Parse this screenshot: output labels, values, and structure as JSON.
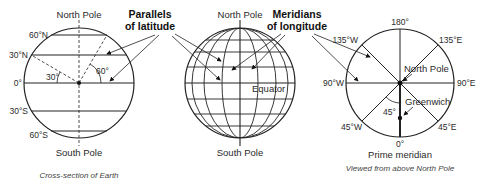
{
  "figure": {
    "left": {
      "title_top": "North Pole",
      "title_bottom": "South Pole",
      "caption": "Cross-section of Earth",
      "latitude_labels": [
        "60°N",
        "30°N",
        "0°",
        "30°S",
        "60°S"
      ],
      "angle_labels": [
        "30°",
        "60°"
      ]
    },
    "middle": {
      "title_top": "North Pole",
      "title_bottom": "South Pole",
      "equator_label": "Equator",
      "parallels_label_line1": "Parallels",
      "parallels_label_line2": "of latitude",
      "meridians_label_line1": "Meridians",
      "meridians_label_line2": "of longitude"
    },
    "right": {
      "center_label": "North Pole",
      "greenwich_label": "Greenwich",
      "angle_label": "45°",
      "longitude_labels": {
        "top": "180°",
        "top_left": "135°W",
        "top_right": "135°E",
        "left": "90°W",
        "right": "90°E",
        "bottom_left": "45°W",
        "bottom_right": "45°E",
        "bottom": "0°"
      },
      "prime_meridian_label": "Prime meridian",
      "caption": "Viewed from above North Pole"
    }
  }
}
